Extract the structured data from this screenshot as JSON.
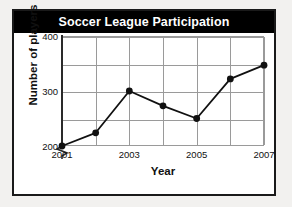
{
  "chart_data": {
    "type": "line",
    "title": "Soccer League Participation",
    "xlabel": "Year",
    "ylabel": "Number of players",
    "x": [
      2001,
      2002,
      2003,
      2004,
      2005,
      2006,
      2007
    ],
    "values": [
      200,
      224,
      300,
      273,
      250,
      322,
      347
    ],
    "series": [
      {
        "name": "Number of players",
        "values": [
          200,
          224,
          300,
          273,
          250,
          322,
          347
        ]
      }
    ],
    "xlim": [
      2001,
      2007
    ],
    "ylim": [
      190,
      400
    ],
    "y_ticks": [
      200,
      250,
      300,
      350,
      400
    ],
    "y_tick_labels": [
      "200",
      "",
      "300",
      "",
      "400"
    ],
    "x_ticks": [
      2001,
      2002,
      2003,
      2004,
      2005,
      2006,
      2007
    ],
    "x_tick_labels": [
      "2001",
      "",
      "2003",
      "",
      "2005",
      "",
      "2007"
    ],
    "grid": true,
    "legend": "none",
    "y_axis_break": true,
    "marker": "filled-circle",
    "line_color": "#111111",
    "marker_color": "#111111",
    "grid_color": "#9a9a9a",
    "title_background": "#000000",
    "title_color": "#ffffff",
    "plot_background": "#ffffff",
    "page_background": "#f2f1ef"
  },
  "axis_labels": {
    "y": [
      {
        "value": 400,
        "label": "400"
      },
      {
        "value": 300,
        "label": "300"
      },
      {
        "value": 200,
        "label": "200"
      }
    ],
    "x": [
      {
        "value": 2001,
        "label": "2001"
      },
      {
        "value": 2003,
        "label": "2003"
      },
      {
        "value": 2005,
        "label": "2005"
      },
      {
        "value": 2007,
        "label": "2007"
      }
    ]
  }
}
